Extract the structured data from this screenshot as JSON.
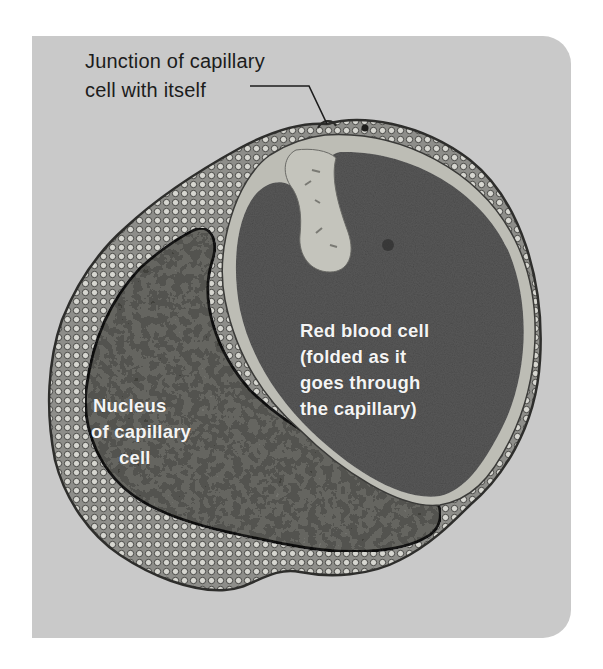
{
  "figure": {
    "type": "labeled electron micrograph illustration",
    "background_color": "#c9c9c9",
    "colors": {
      "panel": "#c9c9c9",
      "red_blood_cell": "#555555",
      "plasma_gap": "#bdbdb5",
      "capillary_wall": "#8a8a86",
      "nucleus": "#6e6e6a",
      "label_dark": "#1c1c1c",
      "label_light": "#f4f4f4"
    },
    "labels": {
      "junction": {
        "lines": [
          "Junction of capillary",
          "cell with itself"
        ],
        "has_leader_line": true
      },
      "red_blood_cell": {
        "lines": [
          "Red blood cell",
          "(folded as it",
          "goes through",
          "the capillary)"
        ]
      },
      "nucleus": {
        "lines": [
          "Nucleus",
          "of capillary",
          "cell"
        ]
      }
    }
  }
}
